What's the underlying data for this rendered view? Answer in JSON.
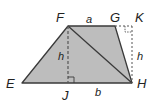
{
  "diagram": {
    "colors": {
      "fill": "#bdbdbd",
      "stroke": "#3a3a3a",
      "dashed": "#555555",
      "text": "#222222"
    },
    "points": {
      "E": {
        "label": "E",
        "x": 22,
        "y": 83
      },
      "F": {
        "label": "F",
        "x": 68,
        "y": 26
      },
      "G": {
        "label": "G",
        "x": 115,
        "y": 26
      },
      "H": {
        "label": "H",
        "x": 132,
        "y": 83
      },
      "J": {
        "label": "J",
        "x": 68,
        "y": 83
      },
      "K": {
        "label": "K",
        "x": 132,
        "y": 26
      }
    },
    "segment_labels": {
      "top_base": "a",
      "bottom_part": "b",
      "height_left": "h",
      "height_right": "h"
    }
  }
}
